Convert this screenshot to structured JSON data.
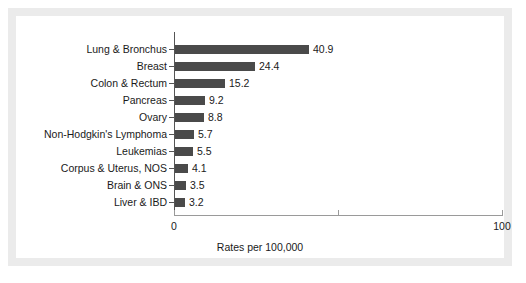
{
  "chart_data": {
    "type": "bar",
    "orientation": "horizontal",
    "title": "",
    "xlabel": "Rates per 100,000",
    "ylabel": "",
    "xlim": [
      0,
      100
    ],
    "xticks": [
      0,
      50,
      100
    ],
    "xtick_labels": [
      "0",
      "",
      "100"
    ],
    "grid": false,
    "legend": false,
    "bar_color": "#4a4a4a",
    "axis_color": "#555555",
    "categories": [
      "Lung & Bronchus",
      "Breast",
      "Colon & Rectum",
      "Pancreas",
      "Ovary",
      "Non-Hodgkin's Lymphoma",
      "Leukemias",
      "Corpus & Uterus, NOS",
      "Brain & ONS",
      "Liver & IBD"
    ],
    "values": [
      40.9,
      24.4,
      15.2,
      9.2,
      8.8,
      5.7,
      5.5,
      4.1,
      3.5,
      3.2
    ],
    "value_labels": [
      "40.9",
      "24.4",
      "15.2",
      "9.2",
      "8.8",
      "5.7",
      "5.5",
      "4.1",
      "3.5",
      "3.2"
    ]
  },
  "frame": {
    "border_color": "#ebebeb",
    "background_color": "#ffffff"
  }
}
